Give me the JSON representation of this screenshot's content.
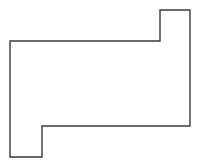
{
  "figure": {
    "name": "orthogonal-polygon-outline",
    "canvas": {
      "width": 199,
      "height": 168,
      "background_color": "#ffffff"
    },
    "style": {
      "stroke_color": "#3a3a3a",
      "stroke_width": 1.4,
      "fill_color": "#ffffff",
      "line_join": "miter"
    },
    "shape": {
      "type": "polygon",
      "closed": true,
      "vertex_count": 8,
      "points": [
        [
          160,
          10
        ],
        [
          190,
          10
        ],
        [
          190,
          126
        ],
        [
          42,
          126
        ],
        [
          42,
          157
        ],
        [
          10,
          157
        ],
        [
          10,
          41
        ],
        [
          160,
          41
        ]
      ],
      "points_attr": "160,10 190,10 190,126 42,126 42,157 10,157 10,41 160,41"
    },
    "edges": [
      {
        "name": "top-edge-of-upper-tab",
        "from": [
          160,
          10
        ],
        "to": [
          190,
          10
        ],
        "orientation": "horizontal",
        "length": 30
      },
      {
        "name": "right-edge",
        "from": [
          190,
          10
        ],
        "to": [
          190,
          126
        ],
        "orientation": "vertical",
        "length": 116
      },
      {
        "name": "bottom-edge-of-body",
        "from": [
          190,
          126
        ],
        "to": [
          42,
          126
        ],
        "orientation": "horizontal",
        "length": 148
      },
      {
        "name": "right-edge-of-lower-tab",
        "from": [
          42,
          126
        ],
        "to": [
          42,
          157
        ],
        "orientation": "vertical",
        "length": 31
      },
      {
        "name": "bottom-edge-of-lower-tab",
        "from": [
          42,
          157
        ],
        "to": [
          10,
          157
        ],
        "orientation": "horizontal",
        "length": 32
      },
      {
        "name": "left-edge",
        "from": [
          10,
          157
        ],
        "to": [
          10,
          41
        ],
        "orientation": "vertical",
        "length": 116
      },
      {
        "name": "top-edge-of-body",
        "from": [
          10,
          41
        ],
        "to": [
          160,
          41
        ],
        "orientation": "horizontal",
        "length": 150
      },
      {
        "name": "left-edge-of-upper-tab",
        "from": [
          160,
          41
        ],
        "to": [
          160,
          10
        ],
        "orientation": "vertical",
        "length": 31
      }
    ]
  }
}
